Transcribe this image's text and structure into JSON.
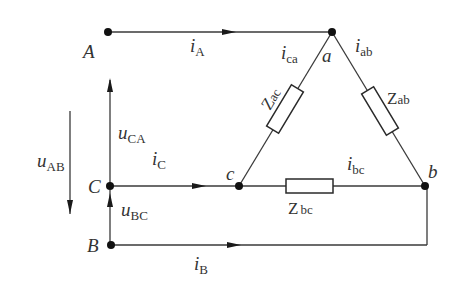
{
  "diagram": {
    "nodes": {
      "A": "A",
      "B": "B",
      "C": "C",
      "a": "a",
      "b": "b",
      "c": "c"
    },
    "currents": {
      "iA": {
        "main": "i",
        "sub": "A"
      },
      "iB": {
        "main": "i",
        "sub": "B"
      },
      "iC": {
        "main": "i",
        "sub": "C"
      },
      "iab": {
        "main": "i",
        "sub": "ab"
      },
      "ibc": {
        "main": "i",
        "sub": "bc"
      },
      "ica": {
        "main": "i",
        "sub": "ca"
      }
    },
    "voltages": {
      "uAB": {
        "main": "u",
        "sub": "AB"
      },
      "uBC": {
        "main": "u",
        "sub": "BC"
      },
      "uCA": {
        "main": "u",
        "sub": "CA"
      }
    },
    "impedances": {
      "Zab": {
        "main": "Z",
        "sub": "ab"
      },
      "Zbc": {
        "main": "Z",
        "sub": "bc"
      },
      "Zac": {
        "main": "Z",
        "sub": "ac"
      }
    },
    "colors": {
      "line": "#3a3a3a",
      "text": "#333333",
      "background": "#ffffff"
    }
  }
}
